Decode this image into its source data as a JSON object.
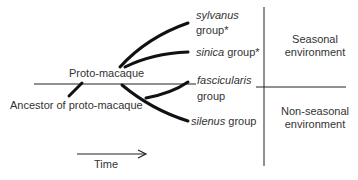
{
  "diagram": {
    "proto_label": "Proto-macaque",
    "ancestor_label": "Ancestor of proto-macaque",
    "time_label": "Time",
    "groups": [
      {
        "name": "sylvanus",
        "suffix": "group*"
      },
      {
        "name": "sinica",
        "suffix": "group*"
      },
      {
        "name": "fascicularis",
        "suffix": "group"
      },
      {
        "name": "silenus",
        "suffix": "group"
      }
    ],
    "environments": {
      "seasonal_line1": "Seasonal",
      "seasonal_line2": "environment",
      "nonseasonal_line1": "Non-seasonal",
      "nonseasonal_line2": "environment"
    },
    "line_color": "#111111"
  }
}
